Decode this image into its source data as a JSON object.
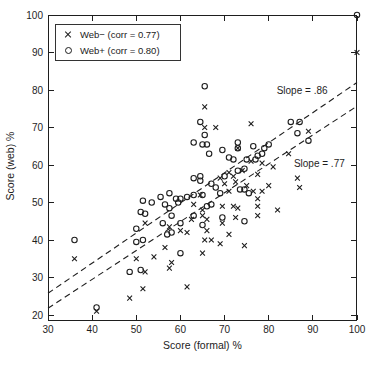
{
  "colors": {
    "ink": "#1e1e1e",
    "background": "#ffffff"
  },
  "chart_data": {
    "type": "scatter",
    "title": "",
    "xlabel": "Score (formal) %",
    "ylabel": "Score (web) %",
    "xlim": [
      30,
      100
    ],
    "ylim": [
      18.4,
      100
    ],
    "xticks": [
      30,
      40,
      50,
      60,
      70,
      80,
      90,
      100
    ],
    "yticks": [
      20,
      30,
      40,
      50,
      60,
      70,
      80,
      90,
      100
    ],
    "grid": false,
    "legend": {
      "position": "top-left",
      "entries": [
        {
          "label": "Web− (corr = 0.77)",
          "marker": "cross"
        },
        {
          "label": "Web+ (corr = 0.80)",
          "marker": "circle"
        }
      ]
    },
    "annotations": [
      {
        "text": "Slope = .86",
        "x": 81.8,
        "y": 80.0
      },
      {
        "text": "Slope = .77",
        "x": 85.7,
        "y": 60.3
      }
    ],
    "trend_lines": [
      {
        "name": "web-plus-fit",
        "slope_label": ".86",
        "x1": 30,
        "y1": 25.8,
        "x2": 100,
        "y2": 82.0,
        "style": "dashed"
      },
      {
        "name": "web-minus-fit",
        "slope_label": ".77",
        "x1": 30,
        "y1": 21.8,
        "x2": 100,
        "y2": 75.7,
        "style": "dashed"
      }
    ],
    "series": [
      {
        "name": "Web− (corr = 0.77)",
        "marker": "cross",
        "points": [
          [
            100,
            90
          ],
          [
            89,
            69
          ],
          [
            84.5,
            63
          ],
          [
            81,
            59.5
          ],
          [
            86.5,
            56.5
          ],
          [
            87,
            54
          ],
          [
            80,
            54.5
          ],
          [
            78.5,
            53
          ],
          [
            82,
            48
          ],
          [
            65.5,
            75.5
          ],
          [
            65.5,
            70
          ],
          [
            68,
            70
          ],
          [
            76,
            71
          ],
          [
            73,
            64.5
          ],
          [
            78.5,
            60.5
          ],
          [
            76,
            61
          ],
          [
            74,
            58.5
          ],
          [
            71,
            58
          ],
          [
            72,
            57
          ],
          [
            69,
            56.5
          ],
          [
            77.5,
            57.5
          ],
          [
            70,
            55
          ],
          [
            72.5,
            55.5
          ],
          [
            75,
            54.5
          ],
          [
            71,
            53
          ],
          [
            76.5,
            53
          ],
          [
            64.5,
            52
          ],
          [
            77.5,
            51
          ],
          [
            63,
            49.5
          ],
          [
            65,
            48
          ],
          [
            69.5,
            49
          ],
          [
            72,
            49
          ],
          [
            73,
            48.5
          ],
          [
            77.5,
            49
          ],
          [
            62.5,
            45.5
          ],
          [
            65,
            46.5
          ],
          [
            66,
            45.5
          ],
          [
            72.5,
            46
          ],
          [
            77.5,
            46.5
          ],
          [
            52,
            44.5
          ],
          [
            57.5,
            43.5
          ],
          [
            60,
            42.5
          ],
          [
            61.5,
            42
          ],
          [
            66,
            42.5
          ],
          [
            69.5,
            44.5
          ],
          [
            71,
            41.5
          ],
          [
            65.5,
            40
          ],
          [
            67,
            40
          ],
          [
            74.5,
            38.5
          ],
          [
            56.5,
            38
          ],
          [
            65,
            36.5
          ],
          [
            54,
            35.5
          ],
          [
            58,
            34
          ],
          [
            57.5,
            32.5
          ],
          [
            69,
            39
          ],
          [
            36,
            35
          ],
          [
            50,
            35
          ],
          [
            52,
            31.5
          ],
          [
            51.5,
            27
          ],
          [
            48.5,
            24.5
          ],
          [
            61.5,
            27.5
          ],
          [
            41,
            21
          ]
        ]
      },
      {
        "name": "Web+ (corr = 0.80)",
        "marker": "circle",
        "points": [
          [
            100,
            100
          ],
          [
            87,
            71.5
          ],
          [
            85,
            71.5
          ],
          [
            86.5,
            68.5
          ],
          [
            89,
            66.5
          ],
          [
            80,
            65.5
          ],
          [
            79,
            64.5
          ],
          [
            78.5,
            63
          ],
          [
            77.5,
            62.5
          ],
          [
            77,
            61.5
          ],
          [
            65.5,
            81
          ],
          [
            64.5,
            71.5
          ],
          [
            65.5,
            68
          ],
          [
            63,
            66
          ],
          [
            65,
            65.5
          ],
          [
            66,
            65.5
          ],
          [
            66.5,
            63
          ],
          [
            69.5,
            64
          ],
          [
            73,
            66
          ],
          [
            73,
            64.5
          ],
          [
            76.5,
            65
          ],
          [
            71,
            62
          ],
          [
            72,
            61.5
          ],
          [
            75,
            61.5
          ],
          [
            74.5,
            59
          ],
          [
            73,
            58.5
          ],
          [
            70,
            57
          ],
          [
            63,
            56.5
          ],
          [
            64.5,
            57
          ],
          [
            64.5,
            55.8
          ],
          [
            67,
            55
          ],
          [
            68,
            54
          ],
          [
            55.5,
            51.5
          ],
          [
            57.5,
            52.5
          ],
          [
            59,
            51
          ],
          [
            60,
            51
          ],
          [
            61.5,
            51.5
          ],
          [
            63,
            52
          ],
          [
            65,
            52
          ],
          [
            69,
            52.5
          ],
          [
            73.5,
            53.5
          ],
          [
            74.5,
            53.5
          ],
          [
            75.5,
            52.5
          ],
          [
            53.5,
            50
          ],
          [
            56.5,
            49.5
          ],
          [
            57.5,
            48.5
          ],
          [
            59.5,
            50
          ],
          [
            66,
            49
          ],
          [
            67,
            49.5
          ],
          [
            58,
            46.5
          ],
          [
            63,
            46.5
          ],
          [
            69.5,
            46
          ],
          [
            56,
            44.5
          ],
          [
            60,
            44.5
          ],
          [
            65,
            44
          ],
          [
            74.5,
            45
          ],
          [
            58,
            42
          ],
          [
            57,
            41.5
          ],
          [
            60,
            36.5
          ],
          [
            51.5,
            50.5
          ],
          [
            51,
            47.5
          ],
          [
            52,
            47
          ],
          [
            50,
            43
          ],
          [
            50,
            39.5
          ],
          [
            51.5,
            40
          ],
          [
            36,
            40
          ],
          [
            48.5,
            31.5
          ],
          [
            51,
            32
          ],
          [
            41,
            22
          ]
        ]
      }
    ]
  }
}
